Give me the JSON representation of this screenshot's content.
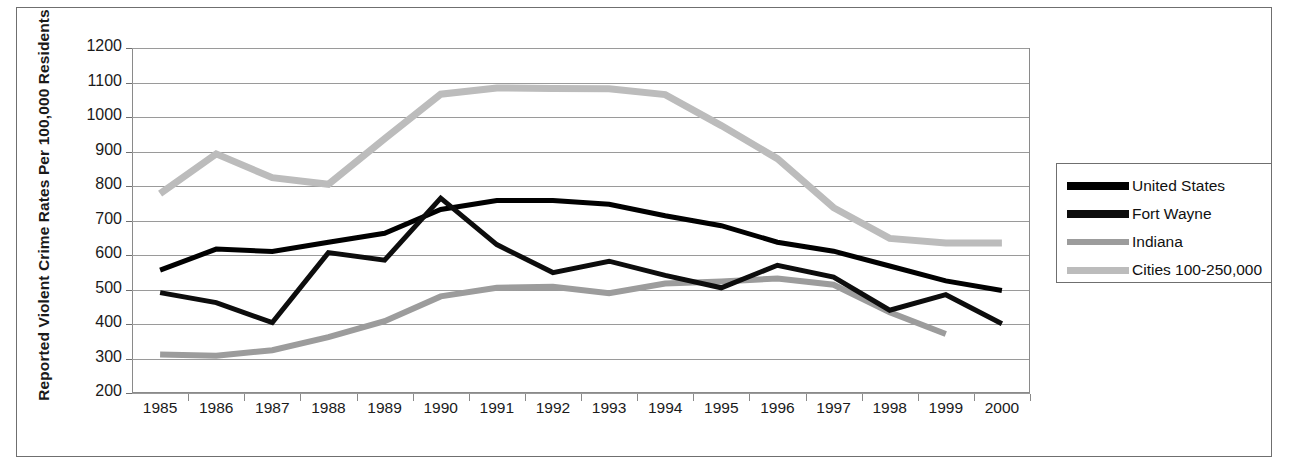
{
  "chart_data": {
    "type": "line",
    "title": "",
    "xlabel": "",
    "ylabel": "Reported Violent Crime Rates Per 100,000 Residents",
    "categories": [
      "1985",
      "1986",
      "1987",
      "1988",
      "1989",
      "1990",
      "1991",
      "1992",
      "1993",
      "1994",
      "1995",
      "1996",
      "1997",
      "1998",
      "1999",
      "2000"
    ],
    "ylim": [
      200,
      1200
    ],
    "ytick_values": [
      1200,
      1100,
      1000,
      900,
      800,
      700,
      600,
      500,
      400,
      300,
      200
    ],
    "ytick_labels": [
      "1200",
      "1100",
      "1000",
      "900",
      "800",
      "700",
      "600",
      "500",
      "400",
      "300",
      "200"
    ],
    "grid": true,
    "legend_position": "right-outside",
    "series": [
      {
        "name": "United States",
        "color": "#000000",
        "width": 5,
        "values": [
          556,
          617,
          610,
          637,
          663,
          732,
          758,
          758,
          747,
          714,
          685,
          637,
          611,
          568,
          525,
          497
        ]
      },
      {
        "name": "Fort Wayne",
        "color": "#0d0d0d",
        "width": 5,
        "values": [
          491,
          462,
          404,
          607,
          585,
          765,
          630,
          549,
          582,
          541,
          505,
          570,
          536,
          440,
          485,
          401
        ]
      },
      {
        "name": "Indiana",
        "color": "#9c9c9c",
        "width": 6,
        "values": [
          312,
          308,
          324,
          362,
          408,
          480,
          505,
          508,
          489,
          517,
          523,
          532,
          514,
          434,
          371,
          null
        ]
      },
      {
        "name": "Cities 100-250,000",
        "color": "#bcbcbc",
        "width": 7,
        "values": [
          778,
          893,
          824,
          805,
          937,
          1066,
          1084,
          1083,
          1082,
          1065,
          975,
          879,
          737,
          648,
          635,
          635
        ]
      }
    ]
  },
  "legend": {
    "items": [
      {
        "label": "United States",
        "color": "#000000"
      },
      {
        "label": "Fort Wayne",
        "color": "#0d0d0d"
      },
      {
        "label": "Indiana",
        "color": "#9c9c9c"
      },
      {
        "label": "Cities 100-250,000",
        "color": "#bcbcbc"
      }
    ]
  }
}
